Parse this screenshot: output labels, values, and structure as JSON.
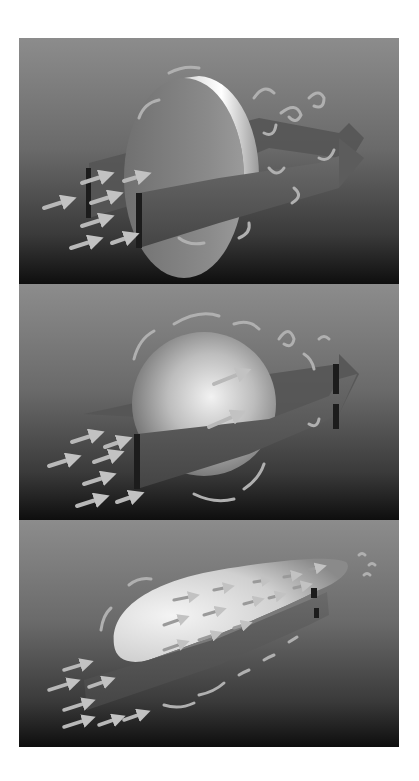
{
  "figure": {
    "panels": [
      {
        "id": "flat-plate",
        "shape": "disc / flat plate",
        "wake": "large turbulent wake"
      },
      {
        "id": "sphere",
        "shape": "sphere",
        "wake": "medium turbulent wake"
      },
      {
        "id": "streamlined-body",
        "shape": "teardrop / streamlined body",
        "wake": "small wake"
      }
    ],
    "colors": {
      "background_top": "#8a8a8a",
      "background_bottom": "#111111",
      "arrow": "#b5b5b5",
      "band": "#5a5a5a",
      "object_light": "#e6e6e6",
      "object_dark": "#6e6e6e"
    }
  }
}
